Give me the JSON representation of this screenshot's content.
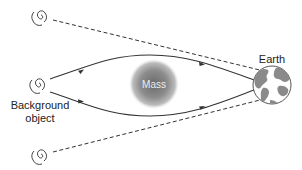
{
  "diagram": {
    "labels": {
      "mass": "Mass",
      "earth": "Earth",
      "background_line1": "Background",
      "background_line2": "object"
    },
    "nodes": [
      {
        "id": "apparent-image-top",
        "type": "spiral-galaxy",
        "role": "apparent image"
      },
      {
        "id": "background-object",
        "type": "spiral-galaxy",
        "role": "true source"
      },
      {
        "id": "apparent-image-bottom",
        "type": "spiral-galaxy",
        "role": "apparent image"
      },
      {
        "id": "mass",
        "type": "lensing-mass",
        "label": "Mass"
      },
      {
        "id": "earth",
        "type": "globe",
        "label": "Earth"
      }
    ],
    "edges": [
      {
        "from": "background-object",
        "to": "earth",
        "style": "solid",
        "path": "upper bent light ray around mass",
        "arrows": 2
      },
      {
        "from": "background-object",
        "to": "earth",
        "style": "solid",
        "path": "lower bent light ray around mass",
        "arrows": 2
      },
      {
        "from": "apparent-image-top",
        "to": "earth",
        "style": "dashed",
        "path": "apparent straight line of sight"
      },
      {
        "from": "apparent-image-bottom",
        "to": "earth",
        "style": "dashed",
        "path": "apparent straight line of sight"
      }
    ],
    "colors": {
      "line": "#333333",
      "mass_center": "#6e6e6e",
      "mass_edge": "#cfcfcf",
      "earth_ocean": "#ffffff",
      "earth_land": "#8a8a8a"
    }
  }
}
